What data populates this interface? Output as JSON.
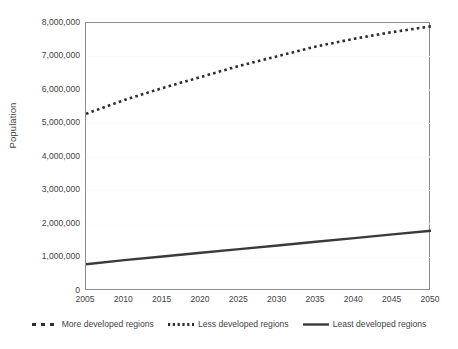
{
  "chart_data": {
    "type": "line",
    "title": "",
    "xlabel": "",
    "ylabel": "Population",
    "x": [
      2005,
      2010,
      2015,
      2020,
      2025,
      2030,
      2035,
      2040,
      2045,
      2050
    ],
    "xlim": [
      2005,
      2050
    ],
    "ylim": [
      0,
      8000000
    ],
    "grid": true,
    "grid_axis": "y",
    "legend_position": "bottom",
    "x_tick_labels": [
      "2005",
      "2010",
      "2015",
      "2020",
      "2025",
      "2030",
      "2035",
      "2040",
      "2045",
      "2050"
    ],
    "y_ticks": [
      0,
      1000000,
      2000000,
      3000000,
      4000000,
      5000000,
      6000000,
      7000000,
      8000000
    ],
    "y_tick_labels": [
      "0",
      "1,000,000",
      "2,000,000",
      "3,000,000",
      "4,000,000",
      "5,000,000",
      "6,000,000",
      "7,000,000",
      "8,000,000"
    ],
    "series": [
      {
        "name": "More developed regions",
        "style": "dashed",
        "color": "#2f2f2f",
        "visible_in_plot": false,
        "values": [
          null,
          null,
          null,
          null,
          null,
          null,
          null,
          null,
          null,
          null
        ]
      },
      {
        "name": "Less developed regions",
        "style": "dotted",
        "color": "#2f2f2f",
        "visible_in_plot": true,
        "values": [
          5290000,
          5700000,
          6060000,
          6390000,
          6720000,
          7010000,
          7300000,
          7530000,
          7730000,
          7900000
        ]
      },
      {
        "name": "Least developed regions",
        "style": "solid",
        "color": "#3a3a3a",
        "visible_in_plot": true,
        "values": [
          800000,
          920000,
          1030000,
          1140000,
          1250000,
          1360000,
          1470000,
          1580000,
          1690000,
          1800000
        ]
      }
    ]
  },
  "legend": {
    "items": [
      {
        "label": "More developed regions",
        "marker": "dashed-line-swatch"
      },
      {
        "label": "Less developed regions",
        "marker": "dotted-line-swatch"
      },
      {
        "label": "Least developed regions",
        "marker": "solid-line-swatch"
      }
    ]
  },
  "colors": {
    "axis": "#8d8d8d",
    "gridline": "#fafafa",
    "text": "#3f3f3f",
    "series_dark": "#2f2f2f",
    "background": "#ffffff"
  }
}
